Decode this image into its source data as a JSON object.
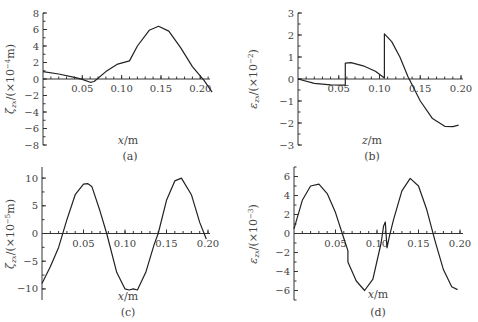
{
  "chart_data": [
    {
      "panel": "a",
      "type": "line",
      "caption": "(a)",
      "xlabel": "x/m",
      "ylabel": "ζ_zx/(×10⁻⁴m)",
      "xlim": [
        0,
        0.22
      ],
      "ylim": [
        -8,
        8
      ],
      "xticks": [
        "0.05",
        "0.10",
        "0.15",
        "0.20"
      ],
      "yticks": [
        "8",
        "6",
        "4",
        "2",
        "0",
        "−2",
        "−4",
        "−6",
        "−8"
      ],
      "series": [
        {
          "name": "ζ_zx",
          "x": [
            0,
            0.02,
            0.04,
            0.05,
            0.06,
            0.065,
            0.08,
            0.095,
            0.11,
            0.12,
            0.135,
            0.147,
            0.16,
            0.175,
            0.19,
            0.205,
            0.215
          ],
          "y": [
            0.9,
            0.6,
            0.2,
            -0.05,
            -0.4,
            -0.3,
            0.9,
            1.8,
            2.2,
            4.0,
            5.9,
            6.4,
            5.8,
            3.8,
            1.5,
            -0.2,
            -1.6
          ]
        }
      ]
    },
    {
      "panel": "b",
      "type": "line",
      "caption": "(b)",
      "xlabel": "z/m",
      "ylabel": "ε_zx/(×10⁻²)",
      "xlim": [
        0,
        0.2
      ],
      "ylim": [
        -3,
        3
      ],
      "xticks": [
        "0.05",
        "0.10",
        "0.15",
        "0.20"
      ],
      "yticks": [
        "3",
        "2",
        "1",
        "0",
        "−1",
        "−2",
        "−3"
      ],
      "series": [
        {
          "name": "ε_zx",
          "x": [
            0,
            0.02,
            0.04,
            0.058,
            0.058,
            0.065,
            0.08,
            0.095,
            0.106,
            0.106,
            0.115,
            0.125,
            0.135,
            0.15,
            0.165,
            0.18,
            0.19,
            0.197
          ],
          "y": [
            0,
            -0.2,
            -0.27,
            -0.28,
            0.72,
            0.74,
            0.6,
            0.35,
            0.05,
            2.05,
            1.7,
            1.0,
            0.1,
            -1.0,
            -1.8,
            -2.15,
            -2.17,
            -2.1
          ]
        }
      ]
    },
    {
      "panel": "c",
      "type": "line",
      "caption": "(c)",
      "xlabel": "x/m",
      "ylabel": "ζ_zx/(×10⁻⁵m)",
      "xlim": [
        0,
        0.2
      ],
      "ylim": [
        -12,
        12
      ],
      "xticks": [
        "0.05",
        "0.10",
        "0.15",
        "0.20"
      ],
      "yticks": [
        "10",
        "5",
        "0",
        "−5",
        "−10"
      ],
      "series": [
        {
          "name": "ζ_zx",
          "x": [
            0,
            0.01,
            0.02,
            0.03,
            0.04,
            0.05,
            0.055,
            0.06,
            0.07,
            0.078,
            0.09,
            0.1,
            0.105,
            0.11,
            0.115,
            0.125,
            0.135,
            0.14,
            0.15,
            0.16,
            0.168,
            0.18,
            0.19,
            0.198
          ],
          "y": [
            -9,
            -6,
            -2.5,
            2.5,
            7,
            8.9,
            9,
            8.5,
            4,
            0,
            -7,
            -10,
            -10.2,
            -10,
            -10.2,
            -7,
            -2,
            0,
            6,
            9.5,
            10,
            7,
            2,
            -1
          ]
        }
      ]
    },
    {
      "panel": "d",
      "type": "line",
      "caption": "(d)",
      "xlabel": "x/m",
      "ylabel": "ε_zx/(×10⁻³)",
      "xlim": [
        0,
        0.2
      ],
      "ylim": [
        -7,
        7
      ],
      "xticks": [
        "0.05",
        "0.10",
        "0.15",
        "0.20"
      ],
      "yticks": [
        "6",
        "4",
        "2",
        "0",
        "−2",
        "−4",
        "−6"
      ],
      "series": [
        {
          "name": "ε_zx",
          "x": [
            0,
            0.01,
            0.02,
            0.03,
            0.04,
            0.05,
            0.06,
            0.065,
            0.065,
            0.075,
            0.085,
            0.095,
            0.105,
            0.108,
            0.11,
            0.112,
            0.115,
            0.12,
            0.13,
            0.14,
            0.15,
            0.16,
            0.17,
            0.18,
            0.19,
            0.197
          ],
          "y": [
            0.5,
            3.5,
            5.0,
            5.2,
            4.2,
            2.2,
            -0.5,
            -1.8,
            -3.0,
            -5.0,
            -6.0,
            -4.8,
            -1.0,
            0.8,
            1.2,
            -1.5,
            -0.3,
            1.5,
            4.5,
            5.8,
            5.0,
            2.5,
            -0.8,
            -3.8,
            -5.6,
            -5.9
          ]
        }
      ]
    }
  ]
}
